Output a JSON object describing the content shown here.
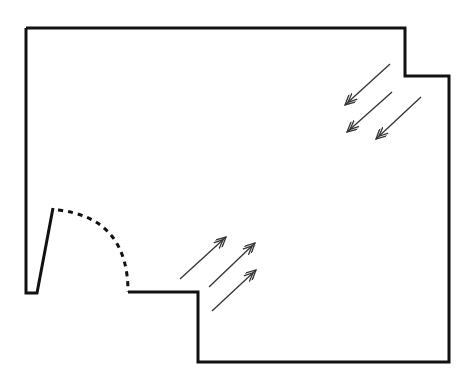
{
  "diagram": {
    "type": "floor-plan",
    "colors": {
      "wall": "#111111",
      "arrow": "#333333",
      "background": "#ffffff"
    },
    "wall_outline": {
      "points": [
        [
          26,
          28
        ],
        [
          405,
          28
        ],
        [
          405,
          76
        ],
        [
          449,
          76
        ],
        [
          449,
          362
        ],
        [
          198,
          362
        ],
        [
          198,
          292
        ],
        [
          128,
          292
        ]
      ],
      "stroke_width": 3
    },
    "door": {
      "leaf": {
        "points": [
          [
            128,
            292
          ],
          [
            128,
            292
          ]
        ]
      },
      "jamb": {
        "points": [
          [
            53,
            208
          ],
          [
            37,
            293
          ],
          [
            26,
            293
          ],
          [
            26,
            28
          ]
        ]
      },
      "swing_arc": {
        "from": [
          58,
          210
        ],
        "to": [
          128,
          292
        ],
        "style": "dashed"
      }
    },
    "arrows": [
      {
        "id": "inflow-1",
        "from": [
          180,
          279
        ],
        "to": [
          226,
          237
        ],
        "direction": "up-right"
      },
      {
        "id": "inflow-2",
        "from": [
          209,
          287
        ],
        "to": [
          255,
          243
        ],
        "direction": "up-right"
      },
      {
        "id": "inflow-3",
        "from": [
          212,
          311
        ],
        "to": [
          256,
          270
        ],
        "direction": "up-right"
      },
      {
        "id": "outflow-1",
        "from": [
          390,
          64
        ],
        "to": [
          345,
          105
        ],
        "direction": "down-left"
      },
      {
        "id": "outflow-2",
        "from": [
          392,
          92
        ],
        "to": [
          347,
          132
        ],
        "direction": "down-left"
      },
      {
        "id": "outflow-3",
        "from": [
          421,
          97
        ],
        "to": [
          376,
          139
        ],
        "direction": "down-left"
      }
    ]
  }
}
